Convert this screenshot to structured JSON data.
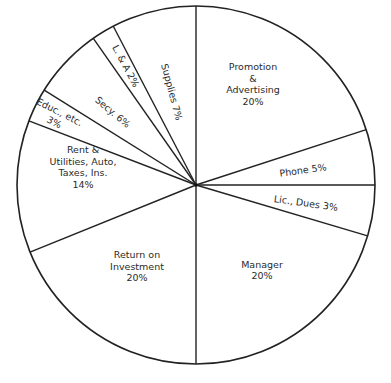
{
  "chart_data": {
    "type": "pie",
    "title": "",
    "caption_partial": "(cut off at bottom edge, illegible)",
    "start_angle_deg": 0,
    "direction": "clockwise",
    "categories": [
      "Promotion & Advertising",
      "Phone",
      "Lic., Dues",
      "Manager",
      "Return on Investment",
      "Rent & Utilities, Auto, Taxes, Ins.",
      "Educ., etc.",
      "Secy.",
      "L. & A",
      "Supplies"
    ],
    "values": [
      20,
      5,
      3,
      20,
      20,
      14,
      3,
      6,
      2,
      7
    ],
    "unit": "%",
    "drawn_boundaries_deg": [
      0,
      72,
      90,
      106.5,
      180,
      248,
      291,
      302,
      325,
      332.5
    ],
    "labels": [
      {
        "lines": [
          "Promotion",
          "&",
          "Advertising",
          "20%"
        ],
        "x": 253,
        "y": 84,
        "rotate": 0
      },
      {
        "lines": [
          "Phone 5%"
        ],
        "x": 303,
        "y": 170,
        "rotate": -8
      },
      {
        "lines": [
          "Lic., Dues 3%"
        ],
        "x": 306,
        "y": 203,
        "rotate": 8
      },
      {
        "lines": [
          "Manager",
          "20%"
        ],
        "x": 262,
        "y": 270,
        "rotate": 0
      },
      {
        "lines": [
          "Return on",
          "Investment",
          "20%"
        ],
        "x": 137,
        "y": 266,
        "rotate": 0
      },
      {
        "lines": [
          "Rent &",
          "Utilities, Auto,",
          "Taxes, Ins.",
          "14%"
        ],
        "x": 83,
        "y": 167,
        "rotate": 0
      },
      {
        "lines": [
          "Educ., etc.",
          "3%"
        ],
        "x": 57,
        "y": 117,
        "rotate": 27
      },
      {
        "lines": [
          "Secy. 6%"
        ],
        "x": 113,
        "y": 112,
        "rotate": 40
      },
      {
        "lines": [
          "L. & A 2%"
        ],
        "x": 126,
        "y": 66,
        "rotate": 62
      },
      {
        "lines": [
          "Supplies 7%"
        ],
        "x": 172,
        "y": 92,
        "rotate": 75
      }
    ],
    "legend": "none (labels inside slices)",
    "grid": false
  },
  "geometry": {
    "cx": 196,
    "cy": 185,
    "r": 179
  },
  "colors": {
    "line": "#222222",
    "text": "#2a2a2a",
    "background": "#ffffff"
  }
}
